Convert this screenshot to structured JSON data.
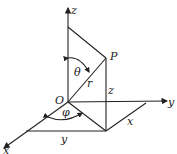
{
  "diagram": {
    "labels": {
      "z_axis": "z",
      "y_axis": "y",
      "x_axis": "x",
      "origin": "O",
      "point": "P",
      "theta": "θ",
      "phi": "φ",
      "radius": "r",
      "z_len": "z",
      "x_len": "x",
      "y_len": "y"
    }
  }
}
